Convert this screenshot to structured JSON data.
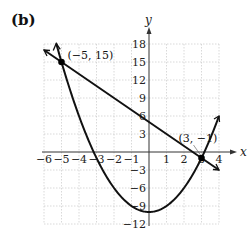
{
  "panel_label": "(b)",
  "chart_data": {
    "type": "line",
    "title": "",
    "xlabel": "x",
    "ylabel": "y",
    "xlim": [
      -6,
      4
    ],
    "ylim": [
      -12,
      18
    ],
    "grid": true,
    "x_ticks": [
      -6,
      -5,
      -4,
      -3,
      -2,
      -1,
      1,
      2,
      3,
      4
    ],
    "x_tick_labels": [
      "−6",
      "−5",
      "−4",
      "−3",
      "−2",
      "−1",
      "1",
      "2",
      "3",
      "4"
    ],
    "y_ticks": [
      -12,
      -9,
      -6,
      -3,
      3,
      6,
      9,
      12,
      15,
      18
    ],
    "y_tick_labels": [
      "−12",
      "−9",
      "−6",
      "−3",
      "3",
      "6",
      "9",
      "12",
      "15",
      "18"
    ],
    "series": [
      {
        "name": "parabola",
        "equation": "y = x^2 - 10",
        "type": "curve",
        "x_range": [
          -5.3,
          4
        ],
        "vertex": [
          0,
          -10
        ]
      },
      {
        "name": "line",
        "equation": "y = -2x + 5",
        "type": "line",
        "x_range": [
          -6,
          4
        ]
      }
    ],
    "points": [
      {
        "x": -5,
        "y": 15,
        "label": "(−5, 15)"
      },
      {
        "x": 3,
        "y": -1,
        "label": "(3, −1)"
      }
    ]
  }
}
